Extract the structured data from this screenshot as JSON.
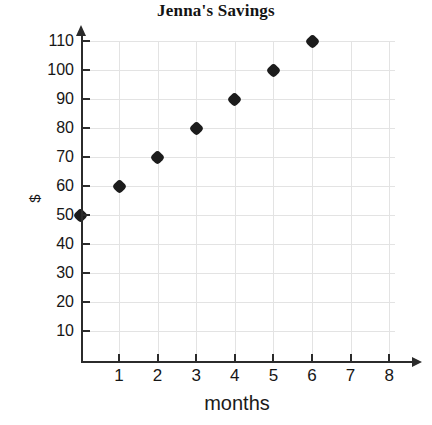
{
  "chart_data": {
    "type": "scatter",
    "title": "Jenna's Savings",
    "xlabel": "months",
    "ylabel": "$",
    "x": [
      0,
      1,
      2,
      3,
      4,
      5,
      6
    ],
    "values": [
      50,
      60,
      70,
      80,
      90,
      100,
      110
    ],
    "points": [
      {
        "x": 0,
        "y": 50
      },
      {
        "x": 1,
        "y": 60
      },
      {
        "x": 2,
        "y": 70
      },
      {
        "x": 3,
        "y": 80
      },
      {
        "x": 4,
        "y": 90
      },
      {
        "x": 5,
        "y": 100
      },
      {
        "x": 6,
        "y": 110
      }
    ],
    "xlim": [
      0,
      8
    ],
    "ylim": [
      0,
      115
    ],
    "xticks": [
      1,
      2,
      3,
      4,
      5,
      6,
      7,
      8
    ],
    "xtick_labels": [
      "1",
      "2",
      "3",
      "4",
      "5",
      "6",
      "7",
      "8"
    ],
    "yticks": [
      10,
      20,
      30,
      40,
      50,
      60,
      70,
      80,
      90,
      100,
      110
    ],
    "ytick_labels": [
      "10",
      "20",
      "30",
      "40",
      "50",
      "60",
      "70",
      "80",
      "90",
      "100",
      "110"
    ],
    "grid": true,
    "legend": null,
    "marker": "diamond",
    "marker_color": "#1c1c1c",
    "grid_color": "#e3e3e3",
    "axis_color": "#2b2b2b",
    "background_color": "#ffffff"
  }
}
